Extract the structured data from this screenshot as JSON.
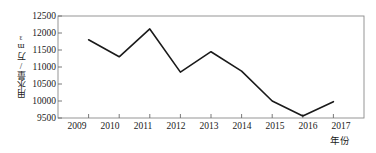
{
  "chart_data": {
    "type": "line",
    "title": "",
    "subtitle": "",
    "xlabel": "年份",
    "ylabel": "用水量/万m³",
    "categories": [
      "2009",
      "2010",
      "2011",
      "2012",
      "2013",
      "2014",
      "2015",
      "2016",
      "2017"
    ],
    "x": [
      2009,
      2010,
      2011,
      2012,
      2013,
      2014,
      2015,
      2016,
      2017
    ],
    "values": [
      11800,
      11300,
      12120,
      10850,
      11450,
      10880,
      10000,
      9560,
      9980
    ],
    "series": [
      {
        "name": "用水量",
        "values": [
          11800,
          11300,
          12120,
          10850,
          11450,
          10880,
          10000,
          9560,
          9980
        ]
      }
    ],
    "ylim": [
      9500,
      12500
    ],
    "yticks": [
      9500,
      10000,
      10500,
      11000,
      11500,
      12000,
      12500
    ],
    "ytick_labels": [
      "9500",
      "10000",
      "10500",
      "11000",
      "11500",
      "12000",
      "12500"
    ],
    "xlim": [
      2008.5,
      2017.5
    ],
    "grid": false,
    "legend": null,
    "legend_position": "none",
    "line_color": "#1a1a1a",
    "line_width": 1.6,
    "markers": false,
    "axis_color": "#6b6b6b",
    "background_color": "#ffffff"
  },
  "axes": {
    "y_title": "用水量/万m³",
    "x_title": "年份"
  }
}
